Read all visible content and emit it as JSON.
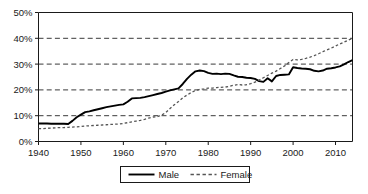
{
  "chart_data": {
    "type": "line",
    "title": "",
    "subtitle": "",
    "xlabel": "",
    "ylabel": "",
    "xlim": [
      1940,
      2014
    ],
    "ylim": [
      0,
      50
    ],
    "grid": "horizontal-dashed",
    "legend_position": "bottom-center",
    "y_ticks": [
      0,
      10,
      20,
      30,
      40,
      50
    ],
    "y_tick_labels": [
      "0%",
      "10%",
      "20%",
      "30%",
      "40%",
      "50%"
    ],
    "x_ticks": [
      1940,
      1950,
      1960,
      1970,
      1980,
      1990,
      2000,
      2010
    ],
    "x_tick_labels": [
      "1940",
      "1950",
      "1960",
      "1970",
      "1980",
      "1990",
      "2000",
      "2010"
    ],
    "x": [
      1940,
      1941,
      1942,
      1943,
      1944,
      1945,
      1946,
      1947,
      1948,
      1949,
      1950,
      1951,
      1952,
      1953,
      1954,
      1955,
      1956,
      1957,
      1958,
      1959,
      1960,
      1961,
      1962,
      1963,
      1964,
      1965,
      1966,
      1967,
      1968,
      1969,
      1970,
      1971,
      1972,
      1973,
      1974,
      1975,
      1976,
      1977,
      1978,
      1979,
      1980,
      1981,
      1982,
      1983,
      1984,
      1985,
      1986,
      1987,
      1988,
      1989,
      1990,
      1991,
      1992,
      1993,
      1994,
      1995,
      1996,
      1997,
      1998,
      1999,
      2000,
      2001,
      2002,
      2003,
      2004,
      2005,
      2006,
      2007,
      2008,
      2009,
      2010,
      2011,
      2012,
      2013,
      2014
    ],
    "series": [
      {
        "name": "Male",
        "style": "solid",
        "color": "#000000",
        "values": [
          7.0,
          7.0,
          7.0,
          6.9,
          6.9,
          6.9,
          6.9,
          6.8,
          8.0,
          9.4,
          10.4,
          11.4,
          11.7,
          12.1,
          12.5,
          12.9,
          13.3,
          13.6,
          13.9,
          14.2,
          14.4,
          15.4,
          16.7,
          16.8,
          16.9,
          17.2,
          17.6,
          18.0,
          18.4,
          18.8,
          19.3,
          19.8,
          20.2,
          20.6,
          22.3,
          24.3,
          25.9,
          27.2,
          27.5,
          27.3,
          26.6,
          26.2,
          26.3,
          26.1,
          26.3,
          26.2,
          25.6,
          25.1,
          25.0,
          24.7,
          24.6,
          24.3,
          23.4,
          23.1,
          24.5,
          23.3,
          25.4,
          25.8,
          25.9,
          26.0,
          28.8,
          28.5,
          28.3,
          28.2,
          28.0,
          27.4,
          27.2,
          27.5,
          28.2,
          28.4,
          28.7,
          29.1,
          29.9,
          30.8,
          31.5
        ]
      },
      {
        "name": "Female",
        "style": "dashed",
        "color": "#555555",
        "values": [
          5.0,
          5.0,
          5.1,
          5.2,
          5.3,
          5.4,
          5.4,
          5.5,
          5.6,
          5.7,
          5.8,
          6.0,
          6.1,
          6.2,
          6.3,
          6.4,
          6.5,
          6.6,
          6.7,
          6.8,
          7.0,
          7.3,
          7.6,
          7.9,
          8.2,
          8.6,
          9.1,
          9.5,
          9.6,
          10.2,
          11.2,
          12.8,
          14.2,
          15.5,
          16.9,
          18.0,
          19.0,
          19.8,
          20.2,
          20.4,
          20.7,
          20.7,
          20.9,
          21.0,
          21.1,
          21.4,
          21.8,
          22.1,
          21.9,
          22.0,
          22.4,
          23.0,
          23.8,
          24.7,
          25.6,
          26.5,
          27.3,
          28.3,
          29.3,
          30.6,
          31.8,
          31.6,
          31.8,
          32.2,
          32.7,
          33.3,
          34.0,
          34.8,
          35.5,
          36.2,
          37.0,
          37.8,
          38.5,
          39.3,
          40.0
        ]
      }
    ]
  },
  "legend": {
    "items": [
      {
        "label": "Male",
        "style": "solid"
      },
      {
        "label": "Female",
        "style": "dashed"
      }
    ]
  }
}
